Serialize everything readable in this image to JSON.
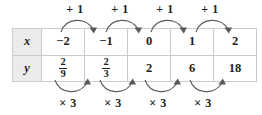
{
  "diagram": {
    "table": {
      "row_headers": [
        "x",
        "y"
      ],
      "columns": 5,
      "x_values": [
        "−2",
        "−1",
        "0",
        "1",
        "2"
      ],
      "y_values_display": [
        "2/9",
        "2/3",
        "2",
        "6",
        "18"
      ],
      "y_values": [
        {
          "type": "fraction",
          "numerator": "2",
          "denominator": "9"
        },
        {
          "type": "fraction",
          "numerator": "2",
          "denominator": "3"
        },
        {
          "type": "integer",
          "text": "2"
        },
        {
          "type": "integer",
          "text": "6"
        },
        {
          "type": "integer",
          "text": "18"
        }
      ]
    },
    "top_annotations": {
      "labels": [
        "+ 1",
        "+ 1",
        "+ 1",
        "+ 1"
      ],
      "arrow_direction": "left-to-right",
      "arc_orientation": "above"
    },
    "bottom_annotations": {
      "labels": [
        "× 3",
        "× 3",
        "× 3",
        "× 3"
      ],
      "arrow_direction": "left-to-right",
      "arc_orientation": "below"
    },
    "colors": {
      "header_fill": "#ebebeb",
      "grid_line": "#c9cbcd",
      "text": "#231f20",
      "header_text": "#4a4a4a",
      "arrow": "#58595b",
      "background": "#ffffff"
    }
  }
}
